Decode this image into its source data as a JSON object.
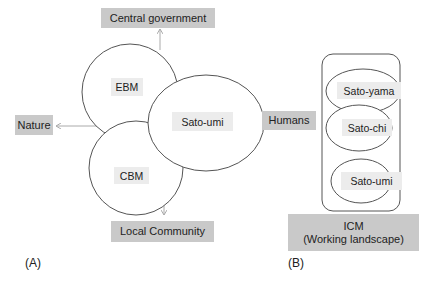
{
  "panel_a": {
    "label": "(A)",
    "outer_boxes": {
      "central_government": "Central government",
      "nature": "Nature",
      "humans": "Humans",
      "local_community": "Local Community"
    },
    "circles": {
      "ebm": "EBM",
      "cbm": "CBM",
      "sato_umi": "Sato-umi"
    }
  },
  "panel_b": {
    "label": "(B)",
    "ellipses": {
      "sato_yama": "Sato-yama",
      "sato_chi": "Sato-chi",
      "sato_umi": "Sato-umi"
    },
    "icm_box": {
      "line1": "ICM",
      "line2": "(Working landscape)"
    }
  },
  "colors": {
    "box_fill": "#c9c9c9",
    "label_fill": "#ececec",
    "stroke": "#555555",
    "arrow": "#aaaaaa"
  }
}
